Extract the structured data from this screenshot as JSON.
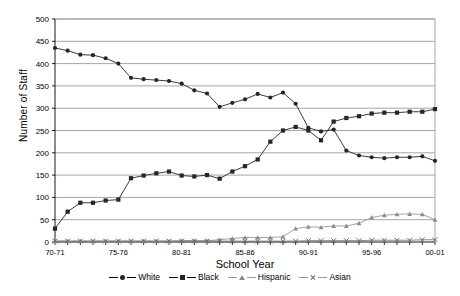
{
  "chart_data": {
    "type": "line",
    "title": "",
    "xlabel": "School Year",
    "ylabel": "Number of Staff",
    "ylim": [
      0,
      500
    ],
    "ystep": 50,
    "grid": true,
    "legend_position": "bottom",
    "x": [
      "70-71",
      "71-72",
      "72-73",
      "73-74",
      "74-75",
      "75-76",
      "76-77",
      "77-78",
      "78-79",
      "79-80",
      "80-81",
      "81-82",
      "82-83",
      "83-84",
      "84-85",
      "85-86",
      "86-87",
      "87-88",
      "88-89",
      "89-90",
      "90-91",
      "91-92",
      "92-93",
      "93-94",
      "94-95",
      "95-96",
      "96-97",
      "97-98",
      "98-99",
      "99-00",
      "00-01"
    ],
    "xtick_labels": [
      "70-71",
      "75-76",
      "80-81",
      "85-86",
      "90-91",
      "95-96",
      "00-01"
    ],
    "xtick_indices": [
      0,
      5,
      10,
      15,
      20,
      25,
      30
    ],
    "ytick_labels": [
      "0",
      "50",
      "100",
      "150",
      "200",
      "250",
      "300",
      "350",
      "400",
      "450",
      "500"
    ],
    "series": [
      {
        "name": "White",
        "marker": "circle",
        "color": "#262626",
        "values": [
          435,
          429,
          420,
          419,
          412,
          400,
          368,
          365,
          363,
          361,
          355,
          340,
          333,
          303,
          312,
          320,
          332,
          324,
          335,
          310,
          256,
          248,
          252,
          205,
          194,
          190,
          188,
          190,
          190,
          192,
          182
        ]
      },
      {
        "name": "Black",
        "marker": "square",
        "color": "#262626",
        "values": [
          30,
          68,
          88,
          88,
          93,
          95,
          143,
          149,
          154,
          158,
          149,
          147,
          150,
          142,
          158,
          170,
          185,
          225,
          250,
          258,
          250,
          228,
          270,
          278,
          282,
          288,
          290,
          290,
          292,
          292,
          298
        ]
      },
      {
        "name": "Hispanic",
        "marker": "triangle",
        "color": "#8c8c8c",
        "values": [
          2,
          2,
          2,
          2,
          2,
          2,
          2,
          2,
          2,
          2,
          3,
          3,
          3,
          5,
          8,
          10,
          10,
          10,
          12,
          30,
          34,
          33,
          36,
          36,
          42,
          55,
          60,
          62,
          63,
          62,
          50
        ]
      },
      {
        "name": "Asian",
        "marker": "x",
        "color": "#6b6b6b",
        "values": [
          2,
          2,
          2,
          2,
          2,
          2,
          2,
          2,
          2,
          2,
          2,
          2,
          2,
          2,
          2,
          2,
          2,
          2,
          2,
          2,
          3,
          3,
          3,
          3,
          3,
          4,
          4,
          4,
          4,
          5,
          5
        ]
      }
    ]
  }
}
